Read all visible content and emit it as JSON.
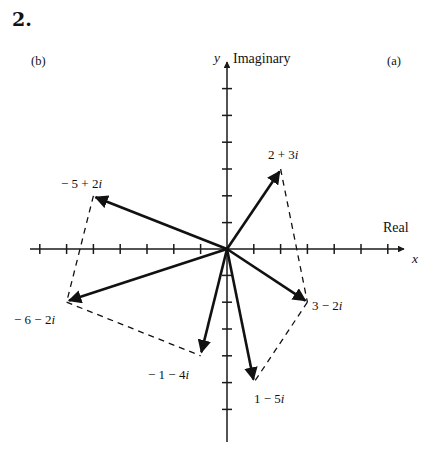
{
  "heading": {
    "number": "2."
  },
  "parts": {
    "a": "(a)",
    "b": "(b)"
  },
  "axes": {
    "y_var": "y",
    "x_var": "x",
    "imaginary_label": "Imaginary",
    "real_label": "Real",
    "origin_px": [
      227,
      249
    ],
    "unit_px": 26.8,
    "x_range": [
      -6.2,
      6.5
    ],
    "y_range": [
      -7.2,
      7.0
    ],
    "tick_marks": true,
    "color": "#1a1a1a"
  },
  "chart_data": {
    "type": "scatter",
    "title": "",
    "xlabel": "Real",
    "ylabel": "Imaginary",
    "xlim": [
      -6.2,
      6.5
    ],
    "ylim": [
      -7.2,
      7.0
    ],
    "grid": false,
    "legend": "none",
    "series": [
      {
        "name": "(a)",
        "group": "a",
        "points": [
          {
            "label": "2 + 3i",
            "re": 2,
            "im": 3,
            "label_x": 268,
            "label_y": 148
          },
          {
            "label": "3 − 2i",
            "re": 3,
            "im": -2,
            "label_x": 312,
            "label_y": 299
          },
          {
            "label": "1 − 5i",
            "re": 1,
            "im": -5,
            "label_x": 254,
            "label_y": 392
          }
        ],
        "vectors_from_origin": true,
        "dashed_path": [
          "2 + 3i",
          "3 − 2i",
          "1 − 5i"
        ]
      },
      {
        "name": "(b)",
        "group": "b",
        "points": [
          {
            "label": "− 5 + 2i",
            "re": -5,
            "im": 2,
            "label_x": 61,
            "label_y": 177
          },
          {
            "label": "− 6 − 2i",
            "re": -6,
            "im": -2,
            "label_x": 14,
            "label_y": 313
          },
          {
            "label": "− 1 − 4i",
            "re": -1,
            "im": -4,
            "label_x": 148,
            "label_y": 368
          }
        ],
        "vectors_from_origin": true,
        "dashed_path": [
          "− 5 + 2i",
          "− 6 − 2i",
          "− 1 − 4i"
        ]
      }
    ]
  }
}
